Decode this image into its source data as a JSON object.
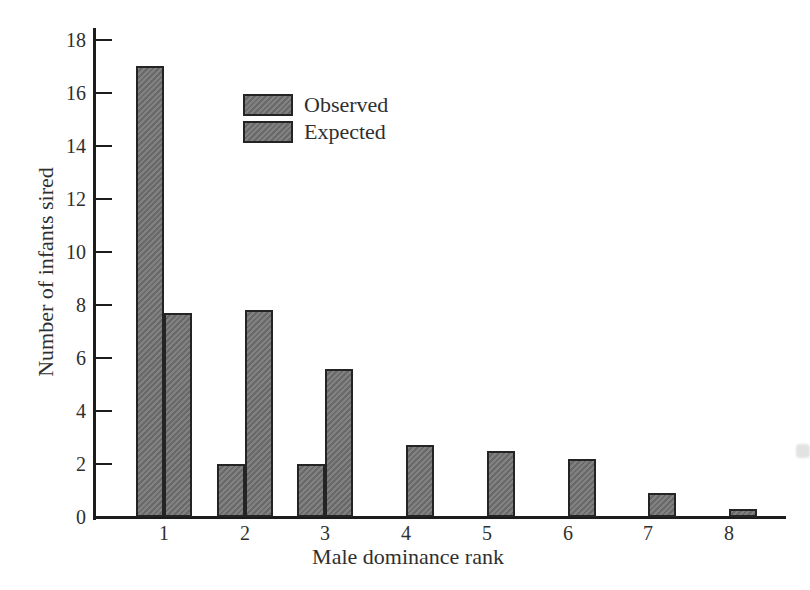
{
  "figure": {
    "background": "#ffffff"
  },
  "chart_data": {
    "type": "bar",
    "title": "",
    "xlabel": "Male dominance rank",
    "ylabel": "Number of infants sired",
    "categories": [
      "1",
      "2",
      "3",
      "4",
      "5",
      "6",
      "7",
      "8"
    ],
    "series": [
      {
        "name": "Observed",
        "values": [
          17,
          2,
          2,
          0,
          0,
          0,
          0,
          0
        ]
      },
      {
        "name": "Expected",
        "values": [
          7.7,
          7.8,
          5.6,
          2.7,
          2.5,
          2.2,
          0.9,
          0.3
        ]
      }
    ],
    "ylim": [
      0,
      18
    ],
    "yticks": [
      0,
      2,
      4,
      6,
      8,
      10,
      12,
      14,
      16,
      18
    ],
    "grid": false,
    "legend_position": "upper-left-of-center",
    "bar_fill": "#818181",
    "bar_hatch": "#696969",
    "bar_border": "#242424",
    "axis_color": "#1c1c1c",
    "text_color": "#2f2f2f"
  }
}
